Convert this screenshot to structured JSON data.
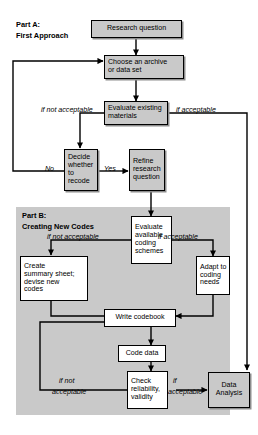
{
  "figure": {
    "type": "flowchart",
    "background": "#ffffff",
    "panel_fill": "#c9c9c9",
    "box_fill_gray": "#c9c9c9",
    "box_fill_white": "#ffffff",
    "stroke": "#000000"
  },
  "sections": [
    {
      "id": "part-a",
      "title_line1": "Part A:",
      "title_line2": "First Approach"
    },
    {
      "id": "part-b",
      "title_line1": "Part B:",
      "title_line2": "Creating New Codes"
    }
  ],
  "nodes": [
    {
      "id": "research-question",
      "label": "Research question",
      "fill": "gray",
      "section": "part-a"
    },
    {
      "id": "choose-archive",
      "label": "Choose an archive\nor data set",
      "fill": "gray",
      "section": "part-a"
    },
    {
      "id": "evaluate-existing",
      "label": "Evaluate existing\nmaterials",
      "fill": "gray",
      "section": "part-a"
    },
    {
      "id": "decide-recode",
      "label": "Decide\nwhether\nto recode",
      "fill": "gray",
      "section": "part-a"
    },
    {
      "id": "refine-question",
      "label": "Refine\nresearch\nquestion",
      "fill": "gray",
      "section": "part-a"
    },
    {
      "id": "evaluate-coding-schemes",
      "label": "Evaluate\navailable\ncoding\nschemes",
      "fill": "white",
      "section": "part-b"
    },
    {
      "id": "create-summary-sheet",
      "label": "Create\nsummary sheet;\ndevise new\ncodes",
      "fill": "white",
      "section": "part-b"
    },
    {
      "id": "adapt-coding-needs",
      "label": "Adapt to\ncoding\nneeds",
      "fill": "white",
      "section": "part-b"
    },
    {
      "id": "write-codebook",
      "label": "Write codebook",
      "fill": "white",
      "section": "part-b"
    },
    {
      "id": "code-data",
      "label": "Code data",
      "fill": "white",
      "section": "part-b"
    },
    {
      "id": "check-reliability",
      "label": "Check\nreliability,\nvalidity",
      "fill": "white",
      "section": "part-b"
    },
    {
      "id": "data-analysis",
      "label": "Data\nAnalysis",
      "fill": "gray",
      "section": "part-b"
    }
  ],
  "edge_labels": [
    {
      "id": "a-if-not-acceptable",
      "text": "if not acceptable",
      "style": "italic"
    },
    {
      "id": "a-if-acceptable",
      "text": "if acceptable",
      "style": "italic"
    },
    {
      "id": "a-no",
      "text": "No",
      "style": "italic"
    },
    {
      "id": "a-yes",
      "text": "Yes",
      "style": "italic"
    },
    {
      "id": "b-if-not-acceptable-top",
      "text": "if not acceptable",
      "style": "italic"
    },
    {
      "id": "b-if-acceptable-top",
      "text": "if acceptable",
      "style": "italic"
    },
    {
      "id": "b-if-not-line1",
      "text": "if not",
      "style": "italic"
    },
    {
      "id": "b-if-not-line2",
      "text": "acceptable",
      "style": "italic"
    },
    {
      "id": "b-if-line1",
      "text": "if",
      "style": "italic"
    },
    {
      "id": "b-if-line2",
      "text": "acceptable",
      "style": "italic"
    }
  ]
}
